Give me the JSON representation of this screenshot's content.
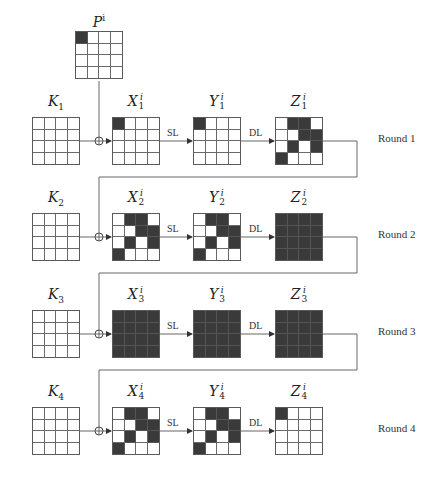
{
  "plaintext": {
    "label": "P",
    "sup": "i",
    "cells": [
      1,
      0,
      0,
      0,
      0,
      0,
      0,
      0,
      0,
      0,
      0,
      0,
      0,
      0,
      0,
      0
    ]
  },
  "operations": {
    "sl": "SL",
    "dl": "DL"
  },
  "rounds": [
    {
      "label": "Round 1",
      "key": {
        "label": "K",
        "sub": "1"
      },
      "x": {
        "label": "X",
        "sub": "1",
        "sup": "i",
        "cells": [
          1,
          0,
          0,
          0,
          0,
          0,
          0,
          0,
          0,
          0,
          0,
          0,
          0,
          0,
          0,
          0
        ]
      },
      "y": {
        "label": "Y",
        "sub": "1",
        "sup": "i",
        "cells": [
          1,
          0,
          0,
          0,
          0,
          0,
          0,
          0,
          0,
          0,
          0,
          0,
          0,
          0,
          0,
          0
        ]
      },
      "z": {
        "label": "Z",
        "sub": "1",
        "sup": "i",
        "cells": [
          0,
          1,
          1,
          0,
          0,
          0,
          1,
          1,
          0,
          1,
          0,
          1,
          1,
          0,
          0,
          0
        ]
      }
    },
    {
      "label": "Round 2",
      "key": {
        "label": "K",
        "sub": "2"
      },
      "x": {
        "label": "X",
        "sub": "2",
        "sup": "i",
        "cells": [
          0,
          1,
          1,
          0,
          0,
          0,
          1,
          1,
          0,
          1,
          0,
          1,
          1,
          0,
          0,
          0
        ]
      },
      "y": {
        "label": "Y",
        "sub": "2",
        "sup": "i",
        "cells": [
          0,
          1,
          1,
          0,
          0,
          0,
          1,
          1,
          0,
          1,
          0,
          1,
          1,
          0,
          0,
          0
        ]
      },
      "z": {
        "label": "Z",
        "sub": "2",
        "sup": "i",
        "cells": [
          1,
          1,
          1,
          1,
          1,
          1,
          1,
          1,
          1,
          1,
          1,
          1,
          1,
          1,
          1,
          1
        ]
      }
    },
    {
      "label": "Round 3",
      "key": {
        "label": "K",
        "sub": "3"
      },
      "x": {
        "label": "X",
        "sub": "3",
        "sup": "i",
        "cells": [
          1,
          1,
          1,
          1,
          1,
          1,
          1,
          1,
          1,
          1,
          1,
          1,
          1,
          1,
          1,
          1
        ]
      },
      "y": {
        "label": "Y",
        "sub": "3",
        "sup": "i",
        "cells": [
          1,
          1,
          1,
          1,
          1,
          1,
          1,
          1,
          1,
          1,
          1,
          1,
          1,
          1,
          1,
          1
        ]
      },
      "z": {
        "label": "Z",
        "sub": "3",
        "sup": "i",
        "cells": [
          1,
          1,
          1,
          1,
          1,
          1,
          1,
          1,
          1,
          1,
          1,
          1,
          1,
          1,
          1,
          1
        ]
      }
    },
    {
      "label": "Round 4",
      "key": {
        "label": "K",
        "sub": "4"
      },
      "x": {
        "label": "X",
        "sub": "4",
        "sup": "i",
        "cells": [
          0,
          1,
          1,
          0,
          0,
          0,
          1,
          1,
          0,
          1,
          0,
          1,
          1,
          0,
          0,
          0
        ]
      },
      "y": {
        "label": "Y",
        "sub": "4",
        "sup": "i",
        "cells": [
          0,
          1,
          1,
          0,
          0,
          0,
          1,
          1,
          0,
          1,
          0,
          1,
          1,
          0,
          0,
          0
        ]
      },
      "z": {
        "label": "Z",
        "sub": "4",
        "sup": "i",
        "cells": [
          1,
          0,
          0,
          0,
          0,
          0,
          0,
          0,
          0,
          0,
          0,
          0,
          0,
          0,
          0,
          0
        ]
      }
    }
  ],
  "colors": {
    "active_cell": "#3a3a3a",
    "line": "#555555"
  }
}
